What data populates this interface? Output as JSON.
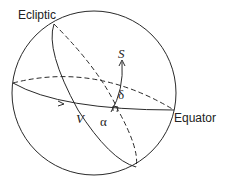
{
  "labels": {
    "ecliptic": "Ecliptic",
    "equator": "Equator",
    "star": "S",
    "vernal_equinox": "V",
    "right_ascension": "α",
    "declination": "δ"
  },
  "colors": {
    "line": "#2a2a2a",
    "background": "#ffffff"
  }
}
